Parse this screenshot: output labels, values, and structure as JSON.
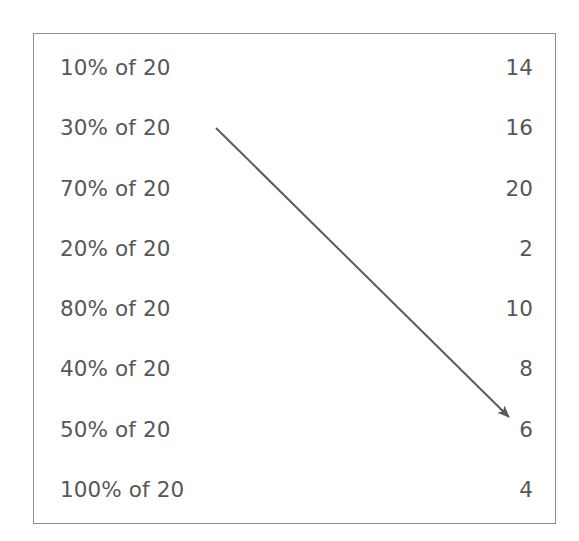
{
  "exercise": {
    "type": "matching",
    "instruction_visible": false,
    "rows": [
      {
        "term": "10% of 20",
        "value": "14"
      },
      {
        "term": "30% of 20",
        "value": "16"
      },
      {
        "term": "70% of 20",
        "value": "20"
      },
      {
        "term": "20% of 20",
        "value": "2"
      },
      {
        "term": "80% of 20",
        "value": "10"
      },
      {
        "term": "40% of 20",
        "value": "8"
      },
      {
        "term": "50% of 20",
        "value": "6"
      },
      {
        "term": "100% of 20",
        "value": "4"
      }
    ],
    "connections": [
      {
        "from_term": "30% of 20",
        "to_value": "6",
        "from_row_index": 1,
        "to_row_index": 6,
        "start": {
          "x": 216,
          "y": 128
        },
        "end": {
          "x": 516,
          "y": 424
        }
      }
    ],
    "colors": {
      "text": "#575757",
      "border": "#8e8e8e",
      "arrow": "#5a5a5a",
      "background": "#ffffff"
    }
  }
}
